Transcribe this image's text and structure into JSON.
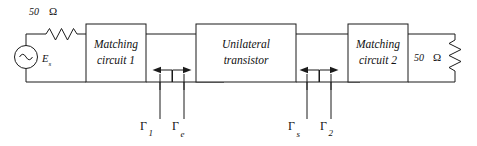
{
  "figure": {
    "type": "circuit-block-diagram",
    "background": "#ffffff",
    "ink_color": "#1b1b1b"
  },
  "source": {
    "symbol": "ac-voltage-source",
    "label": "E",
    "label_sub": "s",
    "series_resistor": {
      "value": "50",
      "unit": "Ω",
      "symbol": "zigzag-resistor"
    }
  },
  "blocks": [
    {
      "id": "matching-circuit-1",
      "line1": "Matching",
      "line2": "circuit 1"
    },
    {
      "id": "unilateral-transistor",
      "line1": "Unilateral",
      "line2": "transistor"
    },
    {
      "id": "matching-circuit-2",
      "line1": "Matching",
      "line2": "circuit 2"
    }
  ],
  "load": {
    "value": "50",
    "unit": "Ω",
    "symbol": "zigzag-resistor"
  },
  "reflection_coefficients": [
    {
      "id": "gamma-1",
      "symbol": "Γ",
      "subscript": "1",
      "arrow": "left"
    },
    {
      "id": "gamma-e",
      "symbol": "Γ",
      "subscript": "e",
      "arrow": "right"
    },
    {
      "id": "gamma-s",
      "symbol": "Γ",
      "subscript": "s",
      "arrow": "left"
    },
    {
      "id": "gamma-2",
      "symbol": "Γ",
      "subscript": "2",
      "arrow": "right"
    }
  ]
}
